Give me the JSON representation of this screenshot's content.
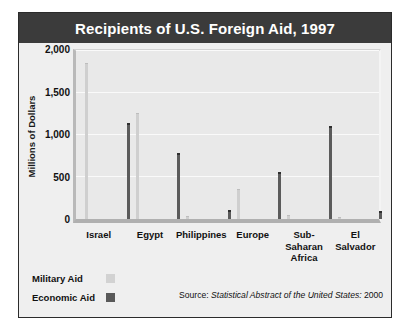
{
  "chart_data": {
    "type": "bar",
    "title": "Recipients of U.S. Foreign Aid, 1997",
    "xlabel": "",
    "ylabel": "Millions of Dollars",
    "ylim": [
      0,
      2000
    ],
    "yticks": [
      0,
      500,
      1000,
      1500,
      2000
    ],
    "ytick_labels": [
      "0",
      "500",
      "1,000",
      "1,500",
      "2,000"
    ],
    "grid": true,
    "legend_position": "bottom-left",
    "categories": [
      "Israel",
      "Egypt",
      "Philippines",
      "Europe",
      "Sub-Saharan Africa",
      "El Salvador"
    ],
    "series": [
      {
        "name": "Military Aid",
        "color": "#cfcfcf",
        "values": [
          1850,
          1250,
          25,
          340,
          30,
          15
        ]
      },
      {
        "name": "Economic Aid",
        "color": "#5b5b5b",
        "values": [
          1120,
          760,
          80,
          530,
          1080,
          70
        ]
      }
    ],
    "source": {
      "prefix": "Source:",
      "title": "Statistical Abstract of the United States:",
      "year": "2000"
    }
  },
  "figure": {
    "title_bar_color": "#3b3b3b",
    "background_color": "#efefef",
    "plot_background_color": "#e9e9e9"
  }
}
